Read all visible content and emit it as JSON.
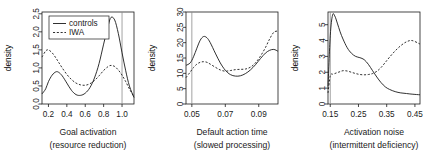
{
  "figure": {
    "background": "#ffffff",
    "foreground": "#1a1a1a",
    "refline_color": "#8c8c8c",
    "panel_count": 3
  },
  "legend": {
    "present_in_panel": 1,
    "entries": [
      {
        "label": "controls",
        "style": "solid",
        "key": "controls"
      },
      {
        "label": "IWA",
        "style": "dashed",
        "key": "iwa"
      }
    ]
  },
  "chart_data": [
    {
      "type": "line",
      "panel_index": 1,
      "title": "",
      "xlabel": "Goal activation",
      "xlabel_sub": "(resource reduction)",
      "ylabel": "density",
      "xlim": [
        0.13,
        1.13
      ],
      "ylim": [
        0.0,
        2.55
      ],
      "xticks": [
        0.2,
        0.4,
        0.6,
        0.8,
        1.0
      ],
      "xticklabels": [
        "0.2",
        "0.4",
        "0.6",
        "0.8",
        "1.0"
      ],
      "yticks": [
        0.0,
        0.5,
        1.0,
        1.5,
        2.0,
        2.5
      ],
      "yticklabels": [
        "0.0",
        "0.5",
        "1.0",
        "1.5",
        "2.0",
        "2.5"
      ],
      "grid": false,
      "reference_line_x": 1.0,
      "legend_position": "top-left",
      "series": [
        {
          "name": "controls",
          "style": "solid",
          "x": [
            0.13,
            0.17,
            0.2,
            0.24,
            0.28,
            0.31,
            0.35,
            0.4,
            0.45,
            0.5,
            0.55,
            0.6,
            0.65,
            0.7,
            0.75,
            0.8,
            0.85,
            0.88,
            0.92,
            0.96,
            1.0,
            1.04,
            1.08,
            1.13
          ],
          "y": [
            0.28,
            0.42,
            0.62,
            0.8,
            0.89,
            0.88,
            0.78,
            0.58,
            0.38,
            0.26,
            0.24,
            0.3,
            0.45,
            0.72,
            1.12,
            1.66,
            2.18,
            2.4,
            2.33,
            1.95,
            1.42,
            0.92,
            0.5,
            0.18
          ]
        },
        {
          "name": "IWA",
          "style": "dashed",
          "x": [
            0.13,
            0.17,
            0.2,
            0.24,
            0.28,
            0.31,
            0.35,
            0.4,
            0.45,
            0.5,
            0.55,
            0.6,
            0.65,
            0.7,
            0.75,
            0.8,
            0.85,
            0.88,
            0.92,
            0.96,
            1.0,
            1.04,
            1.08,
            1.13
          ],
          "y": [
            1.3,
            1.47,
            1.5,
            1.42,
            1.28,
            1.16,
            1.0,
            0.82,
            0.68,
            0.58,
            0.53,
            0.52,
            0.56,
            0.65,
            0.78,
            0.93,
            1.04,
            1.07,
            1.04,
            0.94,
            0.8,
            0.62,
            0.42,
            0.2
          ]
        }
      ]
    },
    {
      "type": "line",
      "panel_index": 2,
      "title": "",
      "xlabel": "Default action time",
      "xlabel_sub": "(slowed processing)",
      "ylabel": "density",
      "xlim": [
        0.0465,
        0.1015
      ],
      "ylim": [
        0,
        30
      ],
      "xticks": [
        0.05,
        0.07,
        0.09
      ],
      "xticklabels": [
        "0.05",
        "0.07",
        "0.09"
      ],
      "yticks": [
        0,
        5,
        10,
        15,
        20,
        25,
        30
      ],
      "yticklabels": [
        "0",
        "5",
        "10",
        "15",
        "20",
        "25",
        "30"
      ],
      "grid": false,
      "reference_line_x": 0.05,
      "legend_position": "none",
      "series": [
        {
          "name": "controls",
          "style": "solid",
          "x": [
            0.0465,
            0.049,
            0.051,
            0.053,
            0.055,
            0.057,
            0.059,
            0.061,
            0.064,
            0.067,
            0.07,
            0.073,
            0.076,
            0.079,
            0.082,
            0.085,
            0.088,
            0.091,
            0.094,
            0.0965,
            0.099,
            0.1015
          ],
          "y": [
            12.6,
            13.4,
            15.4,
            18.2,
            20.8,
            22.0,
            21.6,
            20.0,
            16.6,
            13.4,
            11.0,
            9.6,
            9.1,
            9.2,
            9.9,
            11.1,
            12.8,
            14.8,
            16.6,
            17.5,
            17.8,
            17.2
          ]
        },
        {
          "name": "IWA",
          "style": "dashed",
          "x": [
            0.0465,
            0.049,
            0.051,
            0.053,
            0.055,
            0.057,
            0.059,
            0.061,
            0.064,
            0.067,
            0.07,
            0.073,
            0.076,
            0.079,
            0.082,
            0.085,
            0.088,
            0.091,
            0.094,
            0.0965,
            0.099,
            0.1015
          ],
          "y": [
            8.6,
            10.4,
            11.9,
            13.0,
            13.6,
            13.8,
            13.6,
            13.0,
            12.0,
            11.1,
            10.7,
            10.9,
            11.2,
            11.3,
            11.4,
            12.0,
            13.4,
            15.6,
            18.4,
            21.2,
            23.4,
            23.8
          ]
        }
      ]
    },
    {
      "type": "line",
      "panel_index": 3,
      "title": "",
      "xlabel": "Activation noise",
      "xlabel_sub": "(intermittent deficiency)",
      "ylabel": "density",
      "xlim": [
        0.142,
        0.468
      ],
      "ylim": [
        0,
        5.8
      ],
      "xticks": [
        0.15,
        0.25,
        0.35,
        0.45
      ],
      "xticklabels": [
        "0.15",
        "0.25",
        "0.35",
        "0.45"
      ],
      "yticks": [
        0,
        1,
        2,
        3,
        4,
        5
      ],
      "yticklabels": [
        "0",
        "1",
        "2",
        "3",
        "4",
        "5"
      ],
      "grid": false,
      "reference_line_x": 0.15,
      "legend_position": "none",
      "series": [
        {
          "name": "controls",
          "style": "solid",
          "x": [
            0.142,
            0.15,
            0.158,
            0.166,
            0.175,
            0.185,
            0.195,
            0.21,
            0.225,
            0.24,
            0.255,
            0.27,
            0.285,
            0.3,
            0.315,
            0.33,
            0.345,
            0.36,
            0.38,
            0.4,
            0.42,
            0.44,
            0.468
          ],
          "y": [
            1.1,
            4.3,
            5.6,
            5.55,
            5.1,
            4.55,
            4.1,
            3.55,
            3.2,
            3.0,
            2.92,
            2.8,
            2.5,
            2.1,
            1.7,
            1.35,
            1.08,
            0.92,
            0.78,
            0.7,
            0.66,
            0.62,
            0.58
          ]
        },
        {
          "name": "IWA",
          "style": "dashed",
          "x": [
            0.142,
            0.15,
            0.158,
            0.166,
            0.175,
            0.185,
            0.195,
            0.21,
            0.225,
            0.24,
            0.255,
            0.27,
            0.285,
            0.3,
            0.315,
            0.33,
            0.345,
            0.36,
            0.38,
            0.4,
            0.42,
            0.44,
            0.468
          ],
          "y": [
            0.7,
            1.78,
            1.88,
            1.92,
            1.98,
            2.04,
            2.1,
            2.08,
            2.0,
            1.92,
            1.86,
            1.84,
            1.86,
            1.92,
            2.06,
            2.3,
            2.62,
            2.95,
            3.35,
            3.68,
            3.92,
            4.0,
            3.78
          ]
        }
      ]
    }
  ]
}
